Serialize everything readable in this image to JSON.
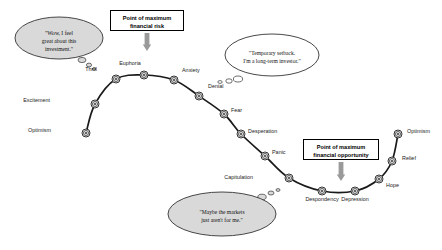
{
  "diagram": {
    "curve_color": "#1a1a1a",
    "node_fill": "#d9d9d9",
    "node_stroke": "#333333",
    "bubble_fill": "#d9d9d9",
    "bubble_stroke": "#333333",
    "arrow_color": "#9a9a9a",
    "box_border": "#000000",
    "background": "#ffffff"
  },
  "nodes": [
    {
      "label": "Optimism",
      "x": 86,
      "y": 133,
      "lx": 51,
      "ly": 131,
      "align": "right"
    },
    {
      "label": "Excitement",
      "x": 95,
      "y": 104,
      "lx": 50,
      "ly": 101,
      "align": "right"
    },
    {
      "label": "Thrill",
      "x": 116,
      "y": 79,
      "lx": 97,
      "ly": 70,
      "align": "right"
    },
    {
      "label": "Euphoria",
      "x": 144,
      "y": 75,
      "lx": 130,
      "ly": 64,
      "align": "center"
    },
    {
      "label": "Anxiety",
      "x": 174,
      "y": 80,
      "lx": 182,
      "ly": 71,
      "align": "left"
    },
    {
      "label": "Denial",
      "x": 199,
      "y": 96,
      "lx": 208,
      "ly": 87,
      "align": "left"
    },
    {
      "label": "Fear",
      "x": 224,
      "y": 114,
      "lx": 231,
      "ly": 111,
      "align": "left"
    },
    {
      "label": "Desperation",
      "x": 241,
      "y": 134,
      "lx": 248,
      "ly": 132,
      "align": "left"
    },
    {
      "label": "Panic",
      "x": 265,
      "y": 156,
      "lx": 272,
      "ly": 153,
      "align": "left"
    },
    {
      "label": "Capitulation",
      "x": 289,
      "y": 178,
      "lx": 253,
      "ly": 178,
      "align": "right"
    },
    {
      "label": "Despondency",
      "x": 322,
      "y": 191,
      "lx": 322,
      "ly": 200,
      "align": "center"
    },
    {
      "label": "Depression",
      "x": 355,
      "y": 191,
      "lx": 355,
      "ly": 200,
      "align": "center"
    },
    {
      "label": "Hope",
      "x": 379,
      "y": 179,
      "lx": 386,
      "ly": 186,
      "align": "left"
    },
    {
      "label": "Relief",
      "x": 392,
      "y": 161,
      "lx": 402,
      "ly": 159,
      "align": "left"
    },
    {
      "label": "Optimism",
      "x": 398,
      "y": 134,
      "lx": 407,
      "ly": 132,
      "align": "left"
    }
  ],
  "callouts": [
    {
      "id": "max-risk",
      "line1": "Point of maximum",
      "line2": "financial risk",
      "box": {
        "x": 110,
        "y": 10,
        "w": 74,
        "h": 21
      },
      "arrow": {
        "x": 147,
        "y1": 33,
        "y2": 51
      }
    },
    {
      "id": "max-opportunity",
      "line1": "Point of maximum",
      "line2": "financial opportunity",
      "box": {
        "x": 303,
        "y": 139,
        "w": 76,
        "h": 21
      },
      "arrow": {
        "x": 341,
        "y1": 162,
        "y2": 181
      }
    }
  ],
  "thought_bubbles": [
    {
      "id": "euphoria-thought",
      "lines": [
        "\"Wow, I feel",
        "great about this",
        "investment.\""
      ],
      "ellipse": {
        "cx": 59,
        "cy": 38,
        "rx": 44,
        "ry": 21
      },
      "text": {
        "x": 59,
        "y": 30
      },
      "trail": [
        {
          "cx": 82,
          "cy": 60,
          "rx": 4.0,
          "ry": 2.6
        },
        {
          "cx": 89,
          "cy": 65,
          "rx": 2.6,
          "ry": 1.9
        },
        {
          "cx": 94,
          "cy": 69,
          "rx": 1.7,
          "ry": 1.3
        }
      ],
      "filled": true
    },
    {
      "id": "denial-thought",
      "lines": [
        "\"Temporary setback.",
        "I'm a long-term investor.\""
      ],
      "ellipse": {
        "cx": 272,
        "cy": 55,
        "rx": 47,
        "ry": 21
      },
      "text": {
        "x": 272,
        "y": 50
      },
      "trail": [
        {
          "cx": 238,
          "cy": 79,
          "rx": 4.6,
          "ry": 3.0
        },
        {
          "cx": 229,
          "cy": 81,
          "rx": 3.2,
          "ry": 2.2
        },
        {
          "cx": 220,
          "cy": 82,
          "rx": 2.2,
          "ry": 1.4
        }
      ],
      "filled": false
    },
    {
      "id": "capitulation-thought",
      "lines": [
        "\"Maybe the markets",
        "just aren't for me.\""
      ],
      "ellipse": {
        "cx": 222,
        "cy": 214,
        "rx": 54,
        "ry": 22
      },
      "text": {
        "x": 222,
        "y": 209
      },
      "trail": [
        {
          "cx": 262,
          "cy": 197,
          "rx": 4.2,
          "ry": 2.8
        },
        {
          "cx": 271,
          "cy": 193,
          "rx": 3.0,
          "ry": 2.0
        },
        {
          "cx": 278,
          "cy": 190,
          "rx": 2.0,
          "ry": 1.4
        }
      ],
      "filled": true
    }
  ]
}
